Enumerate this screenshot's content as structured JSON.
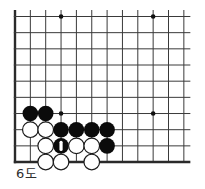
{
  "diagram": {
    "caption": "6도",
    "board": {
      "visible_cols": 12,
      "visible_rows": 10,
      "edges": {
        "left": true,
        "bottom": true,
        "top": false,
        "right": false
      },
      "star_points": [
        {
          "col": 4,
          "row": 1
        },
        {
          "col": 10,
          "row": 1
        },
        {
          "col": 4,
          "row": 7
        },
        {
          "col": 10,
          "row": 7
        }
      ]
    },
    "stones": [
      {
        "col": 2,
        "row": 7,
        "color": "black"
      },
      {
        "col": 3,
        "row": 7,
        "color": "black"
      },
      {
        "col": 2,
        "row": 8,
        "color": "white"
      },
      {
        "col": 3,
        "row": 8,
        "color": "white"
      },
      {
        "col": 4,
        "row": 8,
        "color": "black"
      },
      {
        "col": 5,
        "row": 8,
        "color": "black"
      },
      {
        "col": 6,
        "row": 8,
        "color": "black"
      },
      {
        "col": 7,
        "row": 8,
        "color": "black"
      },
      {
        "col": 3,
        "row": 9,
        "color": "white"
      },
      {
        "col": 4,
        "row": 9,
        "color": "black",
        "label": "1"
      },
      {
        "col": 5,
        "row": 9,
        "color": "white"
      },
      {
        "col": 6,
        "row": 9,
        "color": "white"
      },
      {
        "col": 7,
        "row": 9,
        "color": "black"
      },
      {
        "col": 3,
        "row": 10,
        "color": "white"
      },
      {
        "col": 4,
        "row": 10,
        "color": "white"
      },
      {
        "col": 6,
        "row": 10,
        "color": "white"
      }
    ],
    "colors": {
      "background": "#ffffff",
      "line": "#3a3a3a",
      "edge": "#2a2a2a",
      "star": "#111111",
      "black_stone": "#0b0b0b",
      "white_stone": "#ffffff",
      "white_stone_outline": "#1c1c1c",
      "marker": "#ffffff",
      "caption": "#2e2e2e"
    }
  }
}
